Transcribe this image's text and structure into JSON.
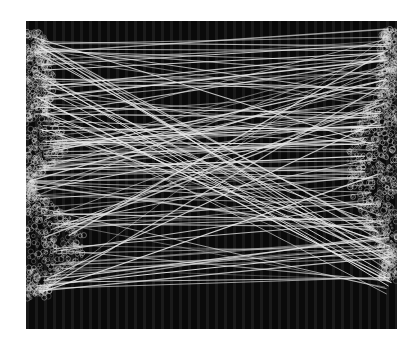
{
  "figure": {
    "background_color": "#0a0a0a",
    "line_color": "#e8e8e8",
    "blob_color": "#d8d8d8",
    "width": 371,
    "height": 308
  },
  "left_blob": {
    "x": 0,
    "y_top": 10,
    "y_bottom": 278,
    "max_width": 70
  },
  "right_blob": {
    "x_right": 371,
    "y_top": 8,
    "y_bottom": 260,
    "max_width": 60
  },
  "matches_count": 140
}
